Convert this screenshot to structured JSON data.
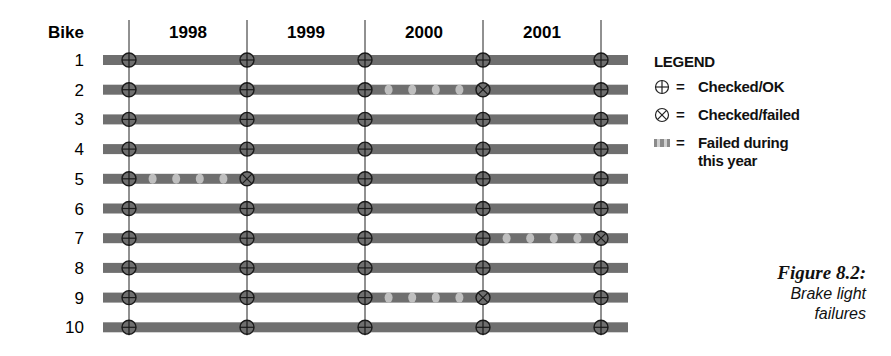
{
  "chart_data": {
    "type": "table",
    "title": "Brake light failures",
    "figure_label": "Figure 8.2:",
    "row_header": "Bike",
    "columns": [
      "1998",
      "1999",
      "2000",
      "2001"
    ],
    "check_points": [
      "start-1998",
      "start-1999",
      "start-2000",
      "start-2001",
      "end-2001"
    ],
    "rows": [
      {
        "bike": "1",
        "checks": [
          "ok",
          "ok",
          "ok",
          "ok",
          "ok"
        ],
        "failed_years": []
      },
      {
        "bike": "2",
        "checks": [
          "ok",
          "ok",
          "ok",
          "failed",
          "ok"
        ],
        "failed_years": [
          "2000"
        ]
      },
      {
        "bike": "3",
        "checks": [
          "ok",
          "ok",
          "ok",
          "ok",
          "ok"
        ],
        "failed_years": []
      },
      {
        "bike": "4",
        "checks": [
          "ok",
          "ok",
          "ok",
          "ok",
          "ok"
        ],
        "failed_years": []
      },
      {
        "bike": "5",
        "checks": [
          "ok",
          "failed",
          "ok",
          "ok",
          "ok"
        ],
        "failed_years": [
          "1998"
        ]
      },
      {
        "bike": "6",
        "checks": [
          "ok",
          "ok",
          "ok",
          "ok",
          "ok"
        ],
        "failed_years": []
      },
      {
        "bike": "7",
        "checks": [
          "ok",
          "ok",
          "ok",
          "ok",
          "failed"
        ],
        "failed_years": [
          "2001"
        ]
      },
      {
        "bike": "8",
        "checks": [
          "ok",
          "ok",
          "ok",
          "ok",
          "ok"
        ],
        "failed_years": []
      },
      {
        "bike": "9",
        "checks": [
          "ok",
          "ok",
          "ok",
          "failed",
          "ok"
        ],
        "failed_years": [
          "2000"
        ]
      },
      {
        "bike": "10",
        "checks": [
          "ok",
          "ok",
          "ok",
          "ok",
          "ok"
        ],
        "failed_years": []
      }
    ],
    "legend": [
      {
        "symbol": "circle-plus",
        "label": "Checked/OK"
      },
      {
        "symbol": "circle-x",
        "label": "Checked/failed"
      },
      {
        "symbol": "dotted-bar",
        "label": "Failed during this year"
      }
    ]
  },
  "legend": {
    "title": "LEGEND",
    "eq": "=",
    "items": [
      {
        "label": "Checked/OK"
      },
      {
        "label": "Checked/failed"
      },
      {
        "label": "Failed during",
        "label2": "this year"
      }
    ]
  },
  "caption": {
    "title": "Figure 8.2:",
    "line1": "Brake light",
    "line2": "failures"
  },
  "colors": {
    "bar": "#6f6f6f",
    "spot": "#c8c8c8",
    "line": "#222222",
    "marker": "#1a1a1a"
  }
}
